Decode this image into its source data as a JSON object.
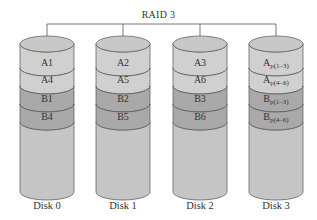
{
  "title": "RAID 3",
  "colors": {
    "top": "#c8c8c8",
    "a_band": "#d0d0d0",
    "b_band": "#a9a9a9",
    "body": "#c5c5c5",
    "stroke": "#555555"
  },
  "disks": [
    {
      "label": "Disk 0",
      "blocks": [
        {
          "main": "A1",
          "sub": ""
        },
        {
          "main": "A4",
          "sub": ""
        },
        {
          "main": "B1",
          "sub": ""
        },
        {
          "main": "B4",
          "sub": ""
        }
      ]
    },
    {
      "label": "Disk 1",
      "blocks": [
        {
          "main": "A2",
          "sub": ""
        },
        {
          "main": "A5",
          "sub": ""
        },
        {
          "main": "B2",
          "sub": ""
        },
        {
          "main": "B5",
          "sub": ""
        }
      ]
    },
    {
      "label": "Disk 2",
      "blocks": [
        {
          "main": "A3",
          "sub": ""
        },
        {
          "main": "A6",
          "sub": ""
        },
        {
          "main": "B3",
          "sub": ""
        },
        {
          "main": "B6",
          "sub": ""
        }
      ]
    },
    {
      "label": "Disk 3",
      "blocks": [
        {
          "main": "A",
          "sub": "p(1–3)"
        },
        {
          "main": "A",
          "sub": "p(4–6)"
        },
        {
          "main": "B",
          "sub": "p(1–3)"
        },
        {
          "main": "B",
          "sub": "p(4–6)"
        }
      ]
    }
  ]
}
